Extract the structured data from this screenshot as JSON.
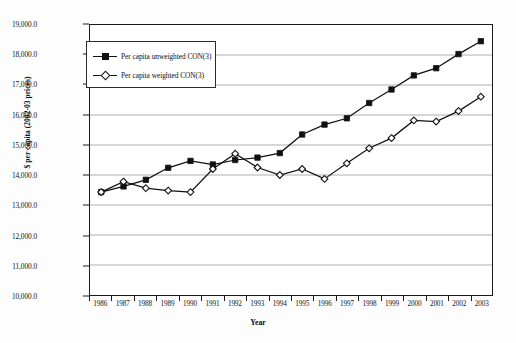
{
  "chart_data": {
    "type": "line",
    "title": "",
    "xlabel": "Year",
    "ylabel": "$ per capita (2002-03 prices)",
    "categories": [
      1986,
      1987,
      1988,
      1989,
      1990,
      1991,
      1992,
      1993,
      1994,
      1995,
      1996,
      1997,
      1998,
      1999,
      2000,
      2001,
      2002,
      2003
    ],
    "xtick_labels": [
      "1986",
      "1987",
      "1988",
      "1989",
      "1990",
      "1991",
      "1992",
      "1993",
      "1994",
      "1995",
      "1996",
      "1997",
      "1998",
      "1999",
      "2000",
      "2001",
      "2002",
      "2003"
    ],
    "ytick_labels": [
      "19,000.0",
      "18,000.0",
      "17,000.0",
      "16,000.0",
      "15,000.0",
      "14,000.0",
      "13,000.0",
      "12,000.0",
      "11,000.0",
      "10,000.0"
    ],
    "ytick_values": [
      19000,
      18000,
      17000,
      16000,
      15000,
      14000,
      13000,
      12000,
      11000,
      10000
    ],
    "ylim": [
      10000,
      19000
    ],
    "grid": "horizontal",
    "legend_position": "upper-left-inside",
    "series": [
      {
        "name": "Per capita unweighted CON(3)",
        "marker": "filled-square",
        "color": "#111111",
        "values": [
          13430,
          13620,
          13840,
          14240,
          14470,
          14350,
          14500,
          14580,
          14730,
          15350,
          15680,
          15890,
          16400,
          16850,
          17320,
          17560,
          18030,
          18460
        ]
      },
      {
        "name": "Per capita weighted CON(3)",
        "marker": "open-diamond",
        "color": "#111111",
        "values": [
          13430,
          13780,
          13560,
          13480,
          13430,
          14200,
          14710,
          14250,
          14000,
          14200,
          13870,
          14390,
          14890,
          15230,
          15820,
          15780,
          16130,
          16610
        ]
      }
    ]
  },
  "legend": {
    "items": [
      {
        "label": "Per capita unweighted CON(3)"
      },
      {
        "label": "Per capita weighted CON(3)"
      }
    ]
  },
  "axes": {
    "y_title": "$ per capita (2002-03 prices)",
    "x_title": "Year"
  }
}
